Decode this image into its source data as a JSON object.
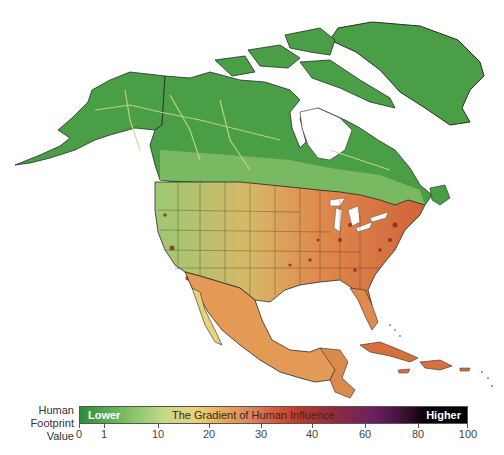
{
  "map": {
    "region": "North America",
    "land_colors": {
      "wild_green": "#4a9e46",
      "low_green": "#8cc46e",
      "mid_yellow": "#e3cf82",
      "mid_orange": "#e39a55",
      "high_red": "#c8402c",
      "very_high": "#3a1030",
      "water": "#ffffff",
      "border": "#2a2a2a"
    }
  },
  "legend": {
    "label_line1": "Human",
    "label_line2": "Footprint",
    "label_line3": "Value",
    "lower_label": "Lower",
    "title": "The Gradient of Human Influence",
    "higher_label": "Higher",
    "ticks": [
      {
        "label": "0",
        "x": 79
      },
      {
        "label": "1",
        "x": 104
      },
      {
        "label": "10",
        "x": 158
      },
      {
        "label": "20",
        "x": 209
      },
      {
        "label": "30",
        "x": 261
      },
      {
        "label": "40",
        "x": 312
      },
      {
        "label": "60",
        "x": 365
      },
      {
        "label": "80",
        "x": 418
      },
      {
        "label": "100",
        "x": 468
      }
    ]
  }
}
